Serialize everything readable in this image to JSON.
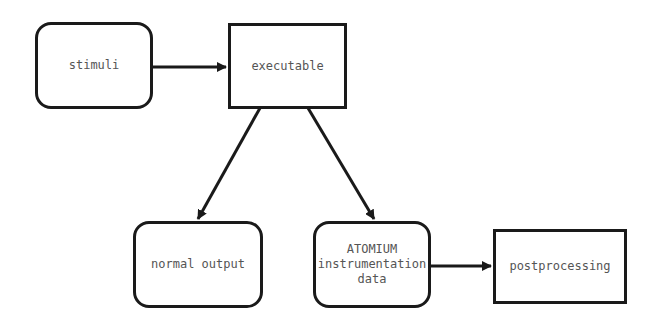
{
  "nodes": {
    "stimuli": {
      "label": "stimuli",
      "shape": "rounded"
    },
    "executable": {
      "label": "executable",
      "shape": "rect"
    },
    "normal_output": {
      "label": "normal output",
      "shape": "rounded"
    },
    "atomium": {
      "label_line1": "ATOMIUM",
      "label_line2": "instrumentation",
      "label_line3": "data",
      "shape": "rounded"
    },
    "postprocessing": {
      "label": "postprocessing",
      "shape": "rect"
    }
  },
  "edges": [
    {
      "from": "stimuli",
      "to": "executable"
    },
    {
      "from": "executable",
      "to": "normal_output"
    },
    {
      "from": "executable",
      "to": "atomium"
    },
    {
      "from": "atomium",
      "to": "postprocessing"
    }
  ],
  "colors": {
    "stroke": "#1a1a1a",
    "text": "#555555",
    "background": "#ffffff"
  }
}
